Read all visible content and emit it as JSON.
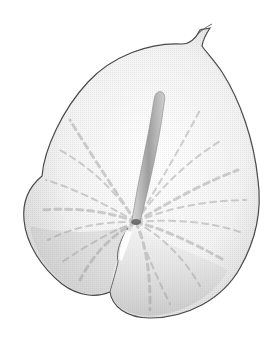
{
  "image": {
    "subject": "anthurium flower spathe",
    "description": "Grayscale, halftone-style rendering of a white anthurium spathe with a central spadix on a white background",
    "colors": {
      "background": "#ffffff",
      "outline": "#4a4a4a",
      "fill_light": "#f4f4f4",
      "shade_mid": "#c8c8c8",
      "shade_dark": "#8a8a8a",
      "spadix": "#a8a8a8"
    }
  }
}
